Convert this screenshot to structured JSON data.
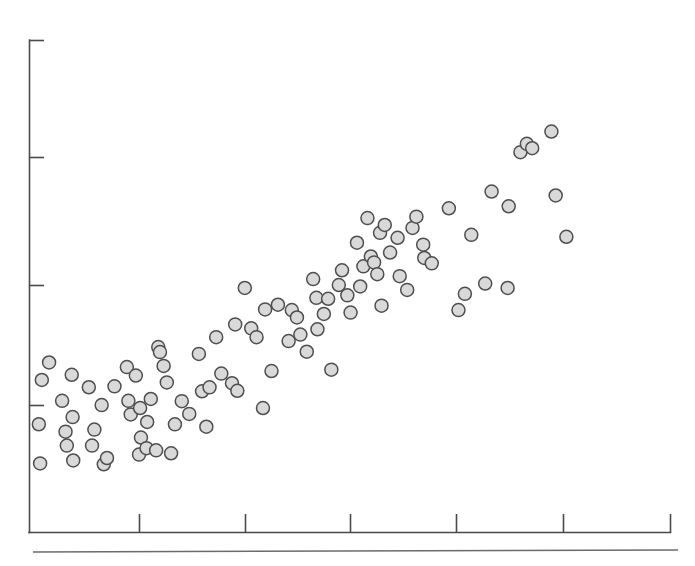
{
  "chart_data": {
    "type": "scatter",
    "title": "",
    "subtitle": "",
    "xlabel": "",
    "ylabel": "",
    "grid": false,
    "legend": null,
    "legend_position": "none",
    "annotations": [],
    "marker": {
      "shape": "circle",
      "fill_color": "#d9d9d9",
      "edge_color": "#4f4f4f",
      "diameter_px": 13
    },
    "axis_color": "#4a4a4a",
    "background_color": "#ffffff",
    "xlim": [
      0,
      6
    ],
    "ylim": [
      0,
      5
    ],
    "xticks": [
      1,
      2,
      3,
      4,
      5,
      6
    ],
    "yticks": [
      1,
      2,
      3,
      4
    ],
    "xtick_labels": [
      "",
      "",
      "",
      "",
      "",
      ""
    ],
    "ytick_labels": [
      "",
      "",
      "",
      ""
    ],
    "n_points": 98,
    "points": [
      [
        0.092,
        1.095
      ],
      [
        0.104,
        0.697
      ],
      [
        0.12,
        1.545
      ],
      [
        0.188,
        1.723
      ],
      [
        0.31,
        1.333
      ],
      [
        0.342,
        1.02
      ],
      [
        0.354,
        0.878
      ],
      [
        0.4,
        1.598
      ],
      [
        0.408,
        1.168
      ],
      [
        0.414,
        0.727
      ],
      [
        0.56,
        1.471
      ],
      [
        0.59,
        0.878
      ],
      [
        0.612,
        1.041
      ],
      [
        0.68,
        1.29
      ],
      [
        0.7,
        0.688
      ],
      [
        0.73,
        0.752
      ],
      [
        0.8,
        1.48
      ],
      [
        0.916,
        1.676
      ],
      [
        0.93,
        1.333
      ],
      [
        0.952,
        1.195
      ],
      [
        1.0,
        1.59
      ],
      [
        1.03,
        0.787
      ],
      [
        1.04,
        1.26
      ],
      [
        1.048,
        0.96
      ],
      [
        1.1,
        0.852
      ],
      [
        1.106,
        1.118
      ],
      [
        1.14,
        1.352
      ],
      [
        1.19,
        0.83
      ],
      [
        1.21,
        1.88
      ],
      [
        1.226,
        1.828
      ],
      [
        1.26,
        1.688
      ],
      [
        1.29,
        1.52
      ],
      [
        1.33,
        0.8
      ],
      [
        1.366,
        1.094
      ],
      [
        1.43,
        1.33
      ],
      [
        1.5,
        1.2
      ],
      [
        1.59,
        1.81
      ],
      [
        1.62,
        1.43
      ],
      [
        1.66,
        1.07
      ],
      [
        1.69,
        1.47
      ],
      [
        1.752,
        1.98
      ],
      [
        1.8,
        1.61
      ],
      [
        1.9,
        1.512
      ],
      [
        1.93,
        2.11
      ],
      [
        1.95,
        1.435
      ],
      [
        2.02,
        2.48
      ],
      [
        2.08,
        2.07
      ],
      [
        2.13,
        1.98
      ],
      [
        2.19,
        1.26
      ],
      [
        2.21,
        2.262
      ],
      [
        2.27,
        1.636
      ],
      [
        2.33,
        2.31
      ],
      [
        2.43,
        1.94
      ],
      [
        2.46,
        2.255
      ],
      [
        2.508,
        2.18
      ],
      [
        2.54,
        2.006
      ],
      [
        2.6,
        1.832
      ],
      [
        2.66,
        2.57
      ],
      [
        2.69,
        2.38
      ],
      [
        2.7,
        2.06
      ],
      [
        2.76,
        2.216
      ],
      [
        2.8,
        2.37
      ],
      [
        2.83,
        1.65
      ],
      [
        2.9,
        2.51
      ],
      [
        2.93,
        2.66
      ],
      [
        2.98,
        2.405
      ],
      [
        3.01,
        2.23
      ],
      [
        3.07,
        2.94
      ],
      [
        3.1,
        2.495
      ],
      [
        3.13,
        2.7
      ],
      [
        3.168,
        3.19
      ],
      [
        3.2,
        2.8
      ],
      [
        3.23,
        2.74
      ],
      [
        3.26,
        2.62
      ],
      [
        3.286,
        3.04
      ],
      [
        3.3,
        2.3
      ],
      [
        3.33,
        3.12
      ],
      [
        3.38,
        2.84
      ],
      [
        3.45,
        2.99
      ],
      [
        3.47,
        2.6
      ],
      [
        3.54,
        2.46
      ],
      [
        3.59,
        3.09
      ],
      [
        3.626,
        3.205
      ],
      [
        3.69,
        2.92
      ],
      [
        3.7,
        2.785
      ],
      [
        3.77,
        2.73
      ],
      [
        3.93,
        3.29
      ],
      [
        4.02,
        2.255
      ],
      [
        4.08,
        2.42
      ],
      [
        4.14,
        3.02
      ],
      [
        4.27,
        2.525
      ],
      [
        4.33,
        3.46
      ],
      [
        4.48,
        2.48
      ],
      [
        4.49,
        3.31
      ],
      [
        4.6,
        3.86
      ],
      [
        4.66,
        3.945
      ],
      [
        4.71,
        3.9
      ],
      [
        4.89,
        4.07
      ],
      [
        4.93,
        3.42
      ],
      [
        5.03,
        3.0
      ]
    ]
  },
  "figure": {
    "width": 695,
    "height": 566,
    "plot_left_px": 29,
    "plot_bottom_px": 532,
    "plot_right_px": 670,
    "plot_top_px": 40,
    "baseline_rule_y_px": 551,
    "baseline_rule_x1_px": 33,
    "baseline_rule_x2_px": 678
  }
}
